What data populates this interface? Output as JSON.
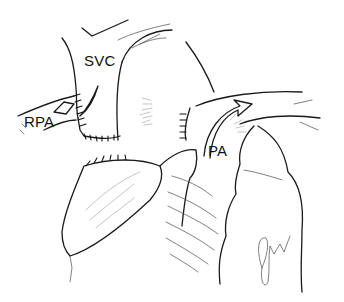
{
  "figure": {
    "type": "surgical-illustration",
    "labels": {
      "svc": "SVC",
      "rpa": "RPA",
      "pa": "PA"
    },
    "signature_icon": "artist-signature",
    "colors": {
      "ink": "#1a1a1a",
      "background": "#ffffff"
    }
  }
}
